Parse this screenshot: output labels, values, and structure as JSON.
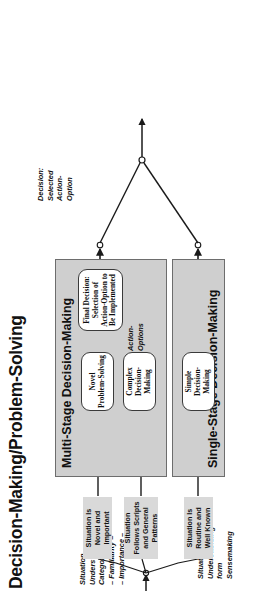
{
  "diagram": {
    "title": "Decision-Making/Problem-Solving",
    "panels": [
      {
        "name": "multi-stage",
        "label": "Multi-Stage Decision-Making"
      },
      {
        "name": "single-stage",
        "label": "Single-Stage Decision-Making"
      }
    ],
    "inputs": {
      "category_label": "Situation\nUnderstanding\nCategories\n– Familiarity –\n– Importance –",
      "category_lines": [
        "Situation",
        "Understanding",
        "Categories",
        "– Familiarity –",
        "– Importance –"
      ],
      "source_lines": [
        "Situation",
        "Understanding",
        "form",
        "Sensemaking"
      ],
      "boxes": [
        {
          "name": "situation-novel-important",
          "text": "Situation Is\nNovel and\nImportant"
        },
        {
          "name": "situation-follows-scripts",
          "text": "Situation\nFollows Scripts\nand General\nPatterns"
        },
        {
          "name": "situation-routine",
          "text": "Situation Is\nRoutine and\nWell Known"
        }
      ]
    },
    "nodes": [
      {
        "name": "novel-problem-solving",
        "text": "Novel\nProblem-Solving"
      },
      {
        "name": "complex-decision-making",
        "text": "Complex\nDecision-Making"
      },
      {
        "name": "final-decision",
        "text": "Final Decision:\nSelection of\nAction-Option to\nBe Implemented"
      },
      {
        "name": "simple-decision-making",
        "text": "Simple\nDecision-Making"
      }
    ],
    "edge_labels": {
      "action_options": "Action-\nOptions",
      "action_options_lines": [
        "Action-",
        "Options"
      ],
      "output": "Decision:\nSelected\nAction-\nOption",
      "output_lines": [
        "Decision:",
        "Selected",
        "Action-",
        "Option"
      ]
    },
    "colors": {
      "panel_fill": "#cfcfcf",
      "panel_stroke": "#6d6d6d",
      "situation_fill": "#d9d9d9",
      "node_fill": "#ffffff",
      "node_stroke": "#3a3a3a",
      "text": "#121212",
      "background": "#ffffff"
    }
  }
}
